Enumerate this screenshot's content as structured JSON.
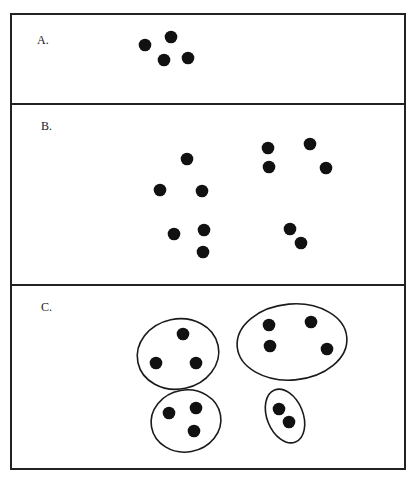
{
  "figure": {
    "frame": {
      "left": 11,
      "top": 14,
      "right": 405,
      "bottom": 469,
      "stroke": "#222222"
    },
    "dividers": [
      104,
      285
    ],
    "dot_radius": 6.3,
    "dot_color": "#111111",
    "panels": [
      {
        "id": "A",
        "label": "A.",
        "label_pos": [
          37,
          44
        ],
        "dots": [
          [
            145,
            45
          ],
          [
            171,
            37
          ],
          [
            164,
            60
          ],
          [
            188,
            58
          ]
        ],
        "enclosures": []
      },
      {
        "id": "B",
        "label": "B.",
        "label_pos": [
          41,
          130
        ],
        "dots": [
          [
            187,
            159
          ],
          [
            160,
            190
          ],
          [
            202,
            191
          ],
          [
            174,
            234
          ],
          [
            204,
            230
          ],
          [
            203,
            252
          ],
          [
            268,
            148
          ],
          [
            310,
            144
          ],
          [
            269,
            167
          ],
          [
            326,
            168
          ],
          [
            290,
            229
          ],
          [
            301,
            243
          ]
        ],
        "enclosures": []
      },
      {
        "id": "C",
        "label": "C.",
        "label_pos": [
          41,
          311
        ],
        "dots": [
          [
            183,
            334
          ],
          [
            156,
            363
          ],
          [
            196,
            363
          ],
          [
            269,
            325
          ],
          [
            311,
            322
          ],
          [
            270,
            346
          ],
          [
            327,
            349
          ],
          [
            169,
            413
          ],
          [
            196,
            408
          ],
          [
            194,
            431
          ],
          [
            279,
            409
          ],
          [
            289,
            422
          ]
        ],
        "enclosures": [
          {
            "cx": 178,
            "cy": 354,
            "rx": 41,
            "ry": 35,
            "rotate": -12
          },
          {
            "cx": 292,
            "cy": 342,
            "rx": 55,
            "ry": 38,
            "rotate": -5
          },
          {
            "cx": 186,
            "cy": 421,
            "rx": 35,
            "ry": 31,
            "rotate": -10
          },
          {
            "cx": 285,
            "cy": 416,
            "rx": 18,
            "ry": 28,
            "rotate": -22
          }
        ]
      }
    ]
  }
}
